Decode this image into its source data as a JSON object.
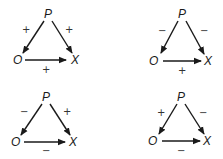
{
  "diagrams": [
    {
      "nodes": {
        "top": "P",
        "left": "O",
        "right": "X"
      },
      "signs": {
        "p_to_o": "+",
        "p_to_x": "+",
        "o_to_x": "+"
      }
    },
    {
      "nodes": {
        "top": "P",
        "left": "O",
        "right": "X"
      },
      "signs": {
        "p_to_o": "−",
        "p_to_x": "−",
        "o_to_x": "+"
      }
    },
    {
      "nodes": {
        "top": "P",
        "left": "O",
        "right": "X"
      },
      "signs": {
        "p_to_o": "−",
        "p_to_x": "+",
        "o_to_x": "−"
      }
    },
    {
      "nodes": {
        "top": "P",
        "left": "O",
        "right": "X"
      },
      "signs": {
        "p_to_o": "+",
        "p_to_x": "−",
        "o_to_x": "−"
      }
    }
  ],
  "colors": {
    "stroke": "#1a1a1a",
    "background": "#ffffff"
  }
}
